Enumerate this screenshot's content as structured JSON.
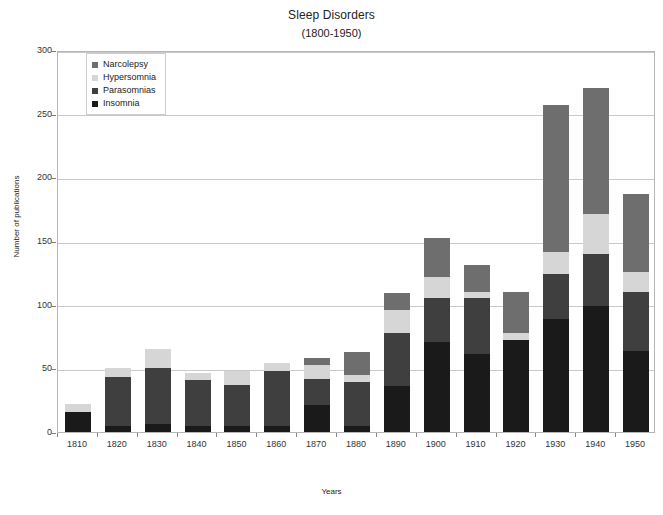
{
  "chart_data": {
    "type": "bar",
    "subtype": "stacked-vertical",
    "title": "Sleep Disorders",
    "subtitle": "(1800-1950)",
    "xlabel": "Years",
    "ylabel": "Number of publications",
    "ylim": [
      0,
      300
    ],
    "ytick_values": [
      0,
      50,
      100,
      150,
      200,
      250,
      300
    ],
    "ytick_labels": [
      "0",
      "50",
      "100",
      "150",
      "200",
      "250",
      "300"
    ],
    "grid": true,
    "legend_position": "top-left-inside",
    "categories": [
      "1810",
      "1820",
      "1830",
      "1840",
      "1850",
      "1860",
      "1870",
      "1880",
      "1890",
      "1900",
      "1910",
      "1920",
      "1930",
      "1940",
      "1950"
    ],
    "series": [
      {
        "name": "Insomnia",
        "color": "#1a1a1a",
        "values": [
          16,
          5,
          6,
          5,
          5,
          5,
          21,
          5,
          36,
          71,
          61,
          72,
          89,
          99,
          64
        ]
      },
      {
        "name": "Parasomnias",
        "color": "#3f3f3f",
        "values": [
          0,
          38,
          44,
          36,
          32,
          43,
          21,
          34,
          42,
          34,
          44,
          0,
          35,
          41,
          46
        ]
      },
      {
        "name": "Hypersomnia",
        "color": "#d6d6d6",
        "values": [
          6,
          7,
          15,
          5,
          11,
          6,
          11,
          6,
          18,
          17,
          5,
          6,
          17,
          31,
          16
        ]
      },
      {
        "name": "Narcolepsy",
        "color": "#6e6e6e",
        "values": [
          0,
          0,
          0,
          0,
          0,
          0,
          5,
          18,
          13,
          30,
          21,
          32,
          116,
          99,
          61
        ]
      }
    ],
    "totals": [
      22,
      50,
      65,
      46,
      48,
      54,
      58,
      63,
      109,
      152,
      131,
      110,
      257,
      270,
      187
    ]
  },
  "legend": {
    "items": [
      {
        "label": "Narcolepsy",
        "color": "#6e6e6e"
      },
      {
        "label": "Hypersomnia",
        "color": "#d6d6d6"
      },
      {
        "label": "Parasomnias",
        "color": "#3f3f3f"
      },
      {
        "label": "Insomnia",
        "color": "#1a1a1a"
      }
    ]
  },
  "colors": {
    "background": "#ffffff",
    "plot_border": "#b6b6b6",
    "gridline": "#c9c9c9",
    "text": "#222222"
  }
}
